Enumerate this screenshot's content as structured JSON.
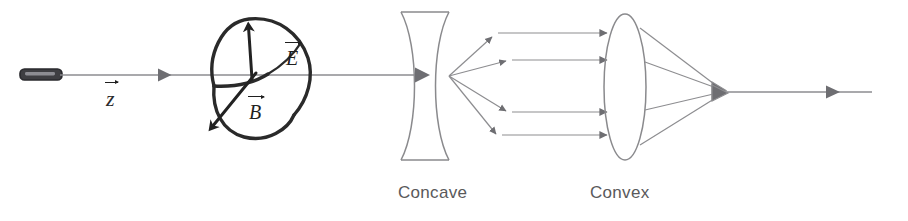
{
  "figure": {
    "kind": "optics-ray-diagram",
    "background_color": "#ffffff",
    "width": 908,
    "height": 221
  },
  "labels": {
    "concave": "Concave",
    "convex": "Convex",
    "propagation_axis": "z",
    "electric_field": "E",
    "magnetic_field": "B"
  },
  "colors": {
    "caption_text": "#59595b",
    "vector_text": "#1f1f1f",
    "ray_line": "#8d8d90",
    "arrow_head": "#6e6e72",
    "lens_outline": "#8a8a8d",
    "wave_outline": "#2a2a2a",
    "source_body": "#3e3e42"
  },
  "elements": {
    "source": {
      "name": "light-source",
      "x": 20,
      "y": 69,
      "width": 42,
      "height": 11
    },
    "axis_ray": {
      "name": "incident-beam",
      "from_x": 60,
      "to_x": 428,
      "y": 75,
      "arrow_x": 168
    },
    "wave": {
      "name": "electromagnetic-wave",
      "center_x": 256,
      "center_y": 76,
      "e_arrow": {
        "from": [
          252,
          78
        ],
        "to": [
          248,
          22
        ]
      },
      "b_arrow": {
        "from": [
          255,
          74
        ],
        "to": [
          208,
          131
        ]
      }
    },
    "concave_lens": {
      "name": "concave-lens",
      "left": 400,
      "right": 450,
      "top": 12,
      "bottom": 160
    },
    "convex_lens": {
      "name": "convex-lens",
      "cx": 625,
      "cy": 87,
      "rx": 21,
      "ry": 73
    },
    "divergence_origin": {
      "x": 449,
      "y": 76
    },
    "focal_point": {
      "x": 724,
      "y": 92
    },
    "exit_ray": {
      "from_x": 728,
      "to_x": 872,
      "y": 92,
      "arrow_x": 838
    }
  },
  "ray_paths": {
    "diverging_count": 4,
    "parallel_count": 4,
    "converging_count": 4,
    "diverging_endpoints": [
      [
        494,
        36
      ],
      [
        508,
        60
      ],
      [
        508,
        112
      ],
      [
        498,
        135
      ]
    ],
    "parallel_ys": [
      33,
      60,
      112,
      135
    ],
    "parallel_end_x": 606,
    "converging_start_x": 644
  }
}
